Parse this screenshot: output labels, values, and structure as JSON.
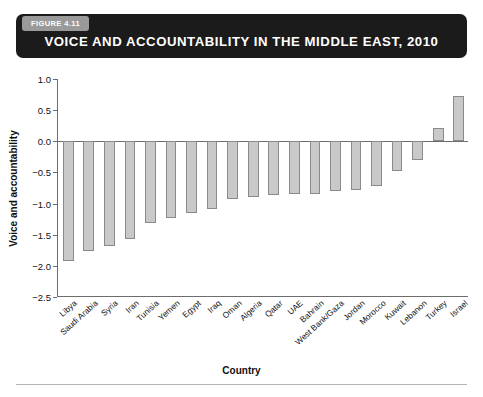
{
  "figure": {
    "badge": "FIGURE 4.11",
    "title": "VOICE AND ACCOUNTABILITY IN THE MIDDLE EAST, 2010"
  },
  "colors": {
    "banner_bg": "#1b1b1b",
    "badge_bg": "#9a9a9a",
    "bar_fill": "#c9c9c9",
    "bar_border": "#8a8a8a",
    "axis": "#6d6d6d"
  },
  "chart_data": {
    "type": "bar",
    "title": "VOICE AND ACCOUNTABILITY IN THE MIDDLE EAST, 2010",
    "xlabel": "Country",
    "ylabel": "Voice and accountability",
    "ylim": [
      -2.5,
      1.0
    ],
    "yticks": [
      1.0,
      0.5,
      0.0,
      -0.5,
      -1.0,
      -1.5,
      -2.0,
      -2.5
    ],
    "ytick_labels": [
      "1.0",
      "0.5",
      "0.0",
      "−0.5",
      "−1.0",
      "−1.5",
      "−2.0",
      "−2.5"
    ],
    "grid": false,
    "legend": null,
    "categories": [
      "Libya",
      "Saudi Arabia",
      "Syria",
      "Iran",
      "Tunisia",
      "Yemen",
      "Egypt",
      "Iraq",
      "Oman",
      "Algeria",
      "Qatar",
      "UAE",
      "Bahrain",
      "West Bank/Gaza",
      "Jordan",
      "Morocco",
      "Kuwait",
      "Lebanon",
      "Turkey",
      "Israel"
    ],
    "values": [
      -1.92,
      -1.76,
      -1.68,
      -1.57,
      -1.32,
      -1.23,
      -1.15,
      -1.08,
      -0.92,
      -0.9,
      -0.87,
      -0.85,
      -0.84,
      -0.8,
      -0.79,
      -0.72,
      -0.47,
      -0.3,
      0.22,
      0.72
    ]
  }
}
